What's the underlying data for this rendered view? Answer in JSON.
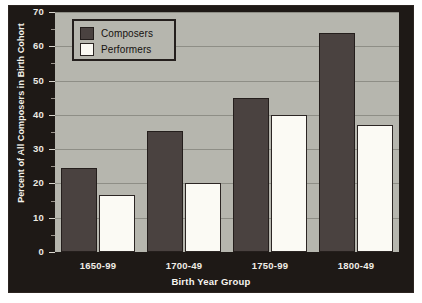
{
  "chart_data": {
    "type": "bar",
    "title": "",
    "xlabel": "Birth Year Group",
    "ylabel": "Percent of All Composers in Birth Cohort",
    "categories": [
      "1650-99",
      "1700-49",
      "1750-99",
      "1800-49"
    ],
    "series": [
      {
        "name": "Composers",
        "color": "#4a4240",
        "values": [
          24.5,
          35.3,
          45.0,
          64.0
        ]
      },
      {
        "name": "Performers",
        "color": "#fbfaf4",
        "values": [
          16.6,
          20.0,
          40.0,
          37.0
        ]
      }
    ],
    "ylim": [
      0,
      70
    ],
    "yticks": [
      0,
      10,
      20,
      30,
      40,
      50,
      60,
      70
    ],
    "ytick_labels": [
      "0",
      "10",
      "20",
      "30",
      "40",
      "50",
      "60",
      "70"
    ],
    "yminor_step": 5,
    "grid": "horizontal",
    "legend_position": "top-left",
    "plot_background": "#b6b6ae",
    "panel_background": "#1e1916"
  }
}
